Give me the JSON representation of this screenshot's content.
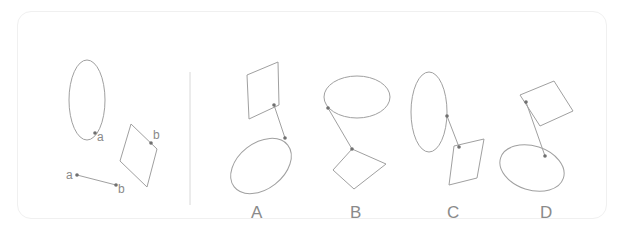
{
  "figure": {
    "type": "spatial reasoning puzzle",
    "given": {
      "point_labels": [
        "a",
        "a",
        "b",
        "b"
      ],
      "shapes": [
        "ellipse",
        "rhombus",
        "segment a-b"
      ]
    },
    "options": [
      {
        "label": "A"
      },
      {
        "label": "B"
      },
      {
        "label": "C"
      },
      {
        "label": "D"
      }
    ],
    "colors": {
      "stroke": "#9a9a9a",
      "text": "#8a8a8a",
      "dot": "#666666"
    }
  }
}
